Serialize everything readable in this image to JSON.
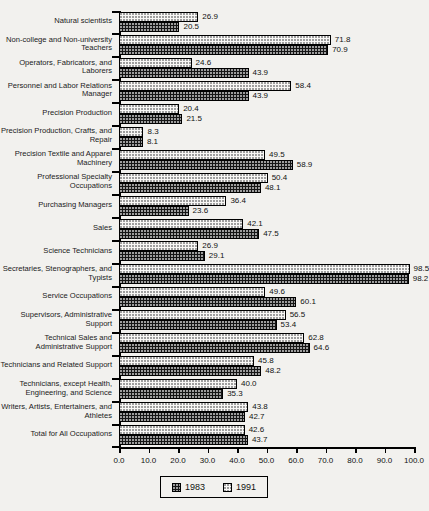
{
  "chart_data": {
    "type": "bar",
    "orientation": "horizontal",
    "title": "",
    "xlabel": "",
    "ylabel": "",
    "xlim": [
      0,
      100
    ],
    "x_ticks": [
      "0.0",
      "10.0",
      "20.0",
      "30.0",
      "40.0",
      "50.0",
      "60.0",
      "70.0",
      "80.0",
      "90.0",
      "100.0"
    ],
    "grid": false,
    "value_labels": true,
    "bar_order_top_to_bottom": [
      "1991",
      "1983"
    ],
    "categories": [
      "Natural scientists",
      "Non-college and Non-university Teachers",
      "Operators, Fabricators, and Laborers",
      "Personnel and Labor Relations Manager",
      "Precision Production",
      "Precision Production, Crafts, and Repair",
      "Precision Textile and Apparel Machinery",
      "Professional Specialty Occupations",
      "Purchasing Managers",
      "Sales",
      "Science Technicians",
      "Secretaries, Stenographers, and Typists",
      "Service Occupations",
      "Supervisors, Administrative Support",
      "Technical Sales and Administrative Support",
      "Technicians and Related Support",
      "Technicians, except Health, Engineering, and Science",
      "Writers, Artists, Entertainers, and Athletes",
      "Total for All Occupations"
    ],
    "series": [
      {
        "name": "1983",
        "values": [
          20.5,
          70.9,
          43.9,
          43.9,
          21.5,
          8.1,
          58.9,
          48.1,
          23.6,
          47.5,
          29.1,
          98.2,
          60.1,
          53.4,
          64.6,
          48.2,
          35.3,
          42.7,
          43.7
        ]
      },
      {
        "name": "1991",
        "values": [
          26.9,
          71.8,
          24.6,
          58.4,
          20.4,
          8.3,
          49.5,
          50.4,
          36.4,
          42.1,
          26.9,
          98.5,
          49.6,
          56.5,
          62.8,
          45.8,
          40.0,
          43.8,
          42.6
        ]
      }
    ],
    "legend": {
      "position": "bottom",
      "entries": [
        {
          "label": "1983",
          "pattern": "dark-crosshatch"
        },
        {
          "label": "1991",
          "pattern": "light-dotted"
        }
      ]
    },
    "colors": {
      "series_1983": "#151515",
      "series_1991": "#f8f7f5",
      "axis": "#000000",
      "text": "#111111",
      "background": "#f2f1ee"
    }
  }
}
